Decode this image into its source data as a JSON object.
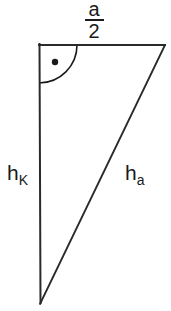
{
  "figure": {
    "background_color": "#ffffff",
    "stroke_color": "#1a1a1a",
    "text_color": "#1a1a1a",
    "width": 171,
    "height": 311
  },
  "labels": {
    "top_fraction": {
      "numerator": "a",
      "denominator": "2",
      "full_text": "a/2"
    },
    "left_side": {
      "base": "h",
      "subscript": "K",
      "full_text": "hK"
    },
    "hypotenuse": {
      "base": "h",
      "subscript": "a",
      "full_text": "ha"
    }
  },
  "geometry": {
    "vertices": {
      "top_left": [
        39,
        45
      ],
      "top_right": [
        165,
        45
      ],
      "bottom_left": [
        40,
        303
      ]
    },
    "edges": [
      {
        "name": "top-edge-a-over-2",
        "from": [
          39,
          45
        ],
        "to": [
          165,
          45
        ]
      },
      {
        "name": "left-edge-h-k",
        "from": [
          39,
          45
        ],
        "to": [
          40,
          303
        ]
      },
      {
        "name": "hypotenuse-h-a",
        "from": [
          165,
          45
        ],
        "to": [
          40,
          303
        ]
      }
    ],
    "right_angle_marker": {
      "vertex": [
        39,
        45
      ],
      "arc_radius": 38,
      "dot_center": [
        55,
        62
      ],
      "dot_radius": 3.2
    }
  },
  "icons": {
    "right_angle": "right-angle-arc-icon",
    "right_angle_dot": "right-angle-dot-icon"
  }
}
